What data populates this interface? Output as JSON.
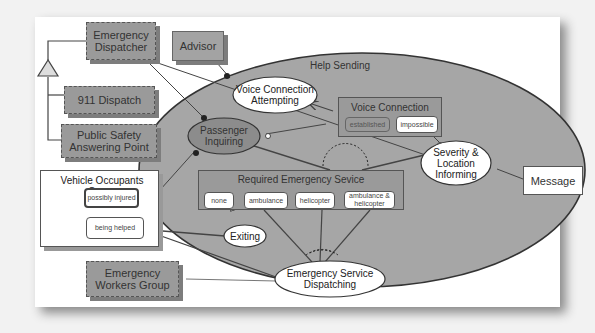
{
  "colors": {
    "background": "#f2f2f2",
    "frame": "#ffffff",
    "process_fill": "#a6a6a6",
    "object_fill": "#9a9a9a",
    "passenger_fill": "#8c8c8c",
    "line": "#333333"
  },
  "objects": {
    "emergency_dispatcher": "Emergency\nDispatcher",
    "advisor": "Advisor",
    "dispatch_911": "911 Dispatch",
    "public_safety": "Public Safety\nAnswering Point",
    "emergency_workers": "Emergency\nWorkers Group",
    "message": "Message"
  },
  "vehicle_group": {
    "title": "Vehicle Occupants Group",
    "states": [
      "possibly injured",
      "being helped"
    ]
  },
  "help_sending": {
    "title": "Help Sending",
    "processes": {
      "voice_attempting": "Voice Connection\nAttempting",
      "passenger_inquiring": "Passenger\nInquiring",
      "severity_informing": "Severity &\nLocation\nInforming",
      "exiting": "Exiting",
      "service_dispatching": "Emergency Service\nDispatching"
    },
    "voice_connection": {
      "title": "Voice Connection",
      "states": [
        "established",
        "impossible"
      ]
    },
    "required_service": {
      "title": "Required Emergency Sevice",
      "states": [
        "none",
        "ambulance",
        "helicopter",
        "ambulance &\nhelicopter"
      ]
    }
  }
}
